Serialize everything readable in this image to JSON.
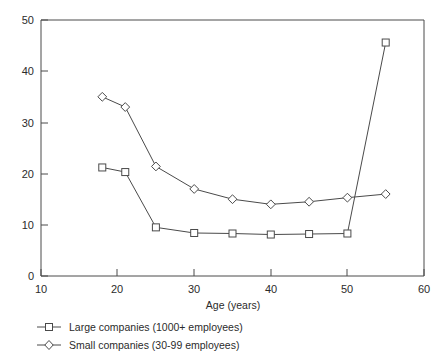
{
  "chart_data": {
    "type": "line",
    "title": "",
    "subtitle": "",
    "xlabel": "Age (years)",
    "ylabel": "",
    "xlim": [
      10,
      60
    ],
    "ylim": [
      0,
      50
    ],
    "xticks": [
      10,
      20,
      30,
      40,
      50,
      60
    ],
    "yticks": [
      0,
      10,
      20,
      30,
      40,
      50
    ],
    "xtick_labels": [
      "10",
      "20",
      "30",
      "40",
      "50",
      "60"
    ],
    "ytick_labels": [
      "0",
      "10",
      "20",
      "30",
      "40",
      "50"
    ],
    "grid": false,
    "legend_position": "below",
    "x": [
      18,
      21,
      25,
      30,
      35,
      40,
      45,
      50,
      55
    ],
    "series": [
      {
        "name": "Large companies (1000+ employees)",
        "marker": "square",
        "values": [
          21.2,
          20.3,
          9.5,
          8.4,
          8.3,
          8.1,
          8.2,
          8.3,
          45.6
        ]
      },
      {
        "name": "Small companies (30-99 employees)",
        "marker": "diamond",
        "values": [
          35.0,
          33.0,
          21.4,
          17.0,
          15.0,
          14.0,
          14.5,
          15.3,
          16.0
        ]
      }
    ],
    "colors": {
      "line": "#4a4a4a",
      "marker_fill": "#ffffff",
      "axis": "#4a4a4a",
      "text": "#2b2b2b",
      "background": "#ffffff"
    }
  },
  "legend": {
    "entries": [
      {
        "label": "Large companies (1000+ employees)",
        "marker": "square-marker-icon"
      },
      {
        "label": "Small companies (30-99 employees)",
        "marker": "diamond-marker-icon"
      }
    ]
  },
  "axis": {
    "x_title": "Age (years)"
  }
}
